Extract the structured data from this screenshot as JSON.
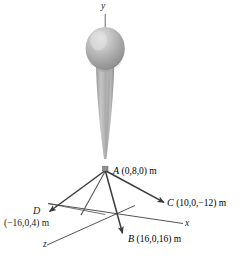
{
  "figure": {
    "units": "m",
    "axes": {
      "y_label": "y",
      "x_label": "x",
      "z_label": "z"
    },
    "points": {
      "A": {
        "name": "A",
        "coord": "(0,8,0) m",
        "values": [
          0,
          8,
          0
        ]
      },
      "B": {
        "name": "B",
        "coord": "(16,0,16) m",
        "values": [
          16,
          0,
          16
        ]
      },
      "C": {
        "name": "C",
        "coord": "(10,0,−12) m",
        "values": [
          10,
          0,
          -12
        ]
      },
      "D": {
        "name": "D",
        "coord": "(−16,0,4) m",
        "values": [
          -16,
          0,
          4
        ]
      }
    },
    "colors": {
      "balloon_light": "#d8d8d8",
      "balloon_mid": "#a9a9a9",
      "balloon_dark": "#8a8a8a",
      "line": "#3a3a3a",
      "axis": "#4a4a4a",
      "text": "#1c1c1c"
    },
    "icons": {
      "balloon": "balloon-icon",
      "arrow": "arrowhead-icon"
    }
  }
}
